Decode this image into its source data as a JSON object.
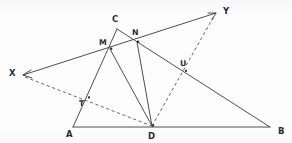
{
  "figure": {
    "background_color": "#fdfdfd",
    "line_color": "#3a3a42",
    "label_color": "#2b2b33",
    "width": 292,
    "height": 143,
    "points": [
      {
        "id": "X",
        "label": "X",
        "x": 23,
        "y": 75,
        "label_x": 9,
        "label_y": 76,
        "kind": "ray-endpoint-arrow"
      },
      {
        "id": "Y",
        "label": "Y",
        "x": 216,
        "y": 13,
        "label_x": 223,
        "label_y": 14,
        "kind": "ray-endpoint-arrow"
      },
      {
        "id": "A",
        "label": "A",
        "x": 73,
        "y": 127,
        "label_x": 66,
        "label_y": 137,
        "kind": "triangle-vertex"
      },
      {
        "id": "B",
        "label": "B",
        "x": 270,
        "y": 127,
        "label_x": 278,
        "label_y": 134,
        "kind": "triangle-vertex"
      },
      {
        "id": "C",
        "label": "C",
        "x": 117,
        "y": 29,
        "label_x": 112,
        "label_y": 22,
        "kind": "triangle-vertex"
      },
      {
        "id": "D",
        "label": "D",
        "x": 152,
        "y": 126,
        "label_x": 148,
        "label_y": 139,
        "kind": "point-on-segment"
      },
      {
        "id": "M",
        "label": "M",
        "x": 110,
        "y": 49,
        "label_x": 99,
        "label_y": 45,
        "kind": "intersection-point"
      },
      {
        "id": "N",
        "label": "N",
        "x": 137,
        "y": 42,
        "label_x": 132,
        "label_y": 35,
        "kind": "intersection-point"
      },
      {
        "id": "T",
        "label": "T",
        "x": 88,
        "y": 98,
        "label_x": 79,
        "label_y": 106,
        "kind": "intersection-point"
      },
      {
        "id": "U",
        "label": "U",
        "x": 185,
        "y": 71,
        "label_x": 180,
        "label_y": 66,
        "kind": "intersection-point"
      }
    ],
    "solid_segments": [
      {
        "name": "line-XY",
        "from": "X",
        "to": "Y",
        "path": "M 23 75 L 216 13"
      },
      {
        "name": "line-AB",
        "from": "A",
        "to": "B",
        "path": "M 73 127 L 270 127"
      },
      {
        "name": "line-AC",
        "from": "A",
        "to": "C",
        "path": "M 73 127 L 117 29"
      },
      {
        "name": "line-CB",
        "from": "C",
        "to": "B",
        "path": "M 117 29 L 270 127"
      },
      {
        "name": "line-MD",
        "from": "M",
        "to": "D",
        "path": "M 110 49 L 152 126"
      },
      {
        "name": "line-ND",
        "from": "N",
        "to": "D",
        "path": "M 137 42 L 152 126"
      }
    ],
    "dashed_segments": [
      {
        "name": "line-XD",
        "from": "X",
        "to": "D",
        "path": "M 25 77 L 152 126"
      },
      {
        "name": "line-DY",
        "from": "D",
        "to": "Y",
        "path": "M 152 126 L 214 16"
      }
    ],
    "arrow_heads": [
      {
        "name": "arrow-head-X",
        "at": "X",
        "path": "M 31 70 L 23 75 L 32 78"
      },
      {
        "name": "arrow-head-Y",
        "at": "Y",
        "path": "M 208 13 L 216 13 L 212 20"
      }
    ]
  }
}
